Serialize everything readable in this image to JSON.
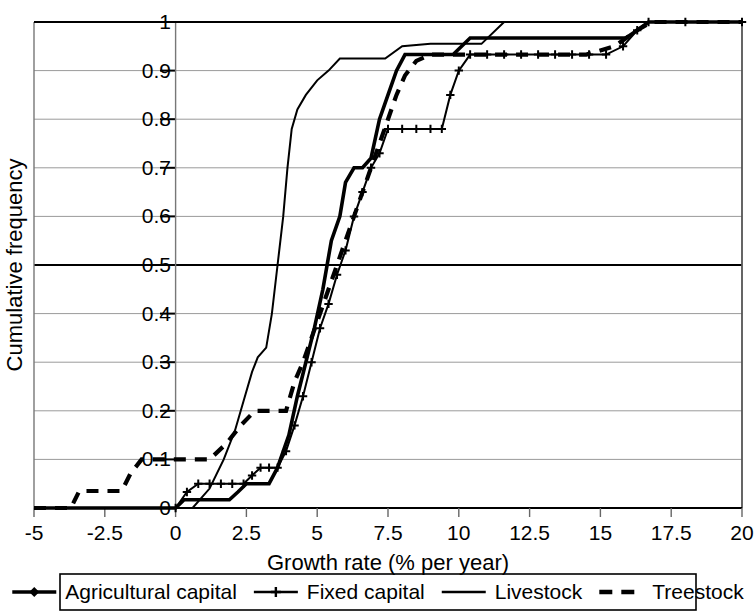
{
  "chart_data": {
    "type": "line",
    "title": "",
    "xlabel": "Growth rate (% per year)",
    "ylabel": "Cumulative frequency",
    "xlim": [
      -5,
      20
    ],
    "ylim": [
      0,
      1
    ],
    "grid": true,
    "legend_position": "bottom",
    "xticks": [
      "-5",
      "-2.5",
      "0",
      "2.5",
      "5",
      "7.5",
      "10",
      "12.5",
      "15",
      "17.5",
      "20"
    ],
    "xtick_values": [
      -5,
      -2.5,
      0,
      2.5,
      5,
      7.5,
      10,
      12.5,
      15,
      17.5,
      20
    ],
    "yticks": [
      "0",
      "0.1",
      "0.2",
      "0.3",
      "0.4",
      "0.5",
      "0.6",
      "0.7",
      "0.8",
      "0.9",
      "1"
    ],
    "ytick_values": [
      0,
      0.1,
      0.2,
      0.3,
      0.4,
      0.5,
      0.6,
      0.7,
      0.8,
      0.9,
      1
    ],
    "series": [
      {
        "name": "Agricultural capital",
        "style": "solid-thick-diamond",
        "marker": "diamond",
        "color": "#000000",
        "points": [
          [
            -5,
            0
          ],
          [
            -4.6,
            0
          ],
          [
            -4.2,
            0
          ],
          [
            -3.8,
            0
          ],
          [
            -3.4,
            0
          ],
          [
            -3.0,
            0
          ],
          [
            -2.6,
            0
          ],
          [
            -2.2,
            0
          ],
          [
            -1.8,
            0
          ],
          [
            -1.4,
            0
          ],
          [
            -1.0,
            0
          ],
          [
            -0.6,
            0
          ],
          [
            -0.2,
            0
          ],
          [
            0,
            0
          ],
          [
            0.3,
            0.017
          ],
          [
            0.7,
            0.017
          ],
          [
            1.1,
            0.017
          ],
          [
            1.5,
            0.017
          ],
          [
            1.9,
            0.017
          ],
          [
            2.2,
            0.033
          ],
          [
            2.5,
            0.05
          ],
          [
            2.9,
            0.05
          ],
          [
            3.3,
            0.05
          ],
          [
            3.6,
            0.083
          ],
          [
            4.0,
            0.15
          ],
          [
            4.3,
            0.23
          ],
          [
            4.6,
            0.3
          ],
          [
            4.9,
            0.37
          ],
          [
            5.2,
            0.45
          ],
          [
            5.5,
            0.55
          ],
          [
            5.8,
            0.6
          ],
          [
            6.0,
            0.67
          ],
          [
            6.3,
            0.7
          ],
          [
            6.6,
            0.7
          ],
          [
            6.9,
            0.72
          ],
          [
            7.2,
            0.8
          ],
          [
            7.5,
            0.85
          ],
          [
            7.8,
            0.9
          ],
          [
            8.1,
            0.933
          ],
          [
            8.6,
            0.933
          ],
          [
            9.2,
            0.933
          ],
          [
            9.8,
            0.933
          ],
          [
            10.4,
            0.967
          ],
          [
            11.0,
            0.967
          ],
          [
            11.7,
            0.967
          ],
          [
            12.4,
            0.967
          ],
          [
            13.1,
            0.967
          ],
          [
            13.8,
            0.967
          ],
          [
            14.5,
            0.967
          ],
          [
            15.2,
            0.967
          ],
          [
            15.9,
            0.967
          ],
          [
            16.3,
            0.983
          ],
          [
            16.7,
            1.0
          ],
          [
            17.3,
            1.0
          ],
          [
            17.9,
            1.0
          ],
          [
            18.5,
            1.0
          ],
          [
            19.1,
            1.0
          ],
          [
            19.6,
            1.0
          ],
          [
            20,
            1.0
          ]
        ]
      },
      {
        "name": "Fixed capital",
        "style": "solid-thin-cross",
        "marker": "cross",
        "color": "#000000",
        "points": [
          [
            0,
            0
          ],
          [
            0.4,
            0.033
          ],
          [
            0.8,
            0.05
          ],
          [
            1.2,
            0.05
          ],
          [
            1.6,
            0.05
          ],
          [
            2.0,
            0.05
          ],
          [
            2.4,
            0.05
          ],
          [
            2.7,
            0.067
          ],
          [
            3.0,
            0.083
          ],
          [
            3.3,
            0.083
          ],
          [
            3.6,
            0.083
          ],
          [
            3.9,
            0.117
          ],
          [
            4.2,
            0.17
          ],
          [
            4.5,
            0.23
          ],
          [
            4.8,
            0.3
          ],
          [
            5.1,
            0.37
          ],
          [
            5.4,
            0.42
          ],
          [
            5.7,
            0.48
          ],
          [
            6.0,
            0.53
          ],
          [
            6.3,
            0.6
          ],
          [
            6.6,
            0.65
          ],
          [
            6.9,
            0.7
          ],
          [
            7.2,
            0.73
          ],
          [
            7.5,
            0.78
          ],
          [
            8.0,
            0.78
          ],
          [
            8.5,
            0.78
          ],
          [
            9.0,
            0.78
          ],
          [
            9.4,
            0.78
          ],
          [
            9.7,
            0.85
          ],
          [
            10.0,
            0.9
          ],
          [
            10.4,
            0.933
          ],
          [
            11.0,
            0.933
          ],
          [
            11.6,
            0.933
          ],
          [
            12.2,
            0.933
          ],
          [
            12.8,
            0.933
          ],
          [
            13.4,
            0.933
          ],
          [
            14.0,
            0.933
          ],
          [
            14.6,
            0.933
          ],
          [
            15.2,
            0.933
          ],
          [
            15.8,
            0.95
          ],
          [
            16.3,
            0.983
          ],
          [
            16.7,
            1.0
          ],
          [
            18,
            1.0
          ],
          [
            20,
            1.0
          ]
        ]
      },
      {
        "name": "Livestock",
        "style": "solid-thin",
        "marker": "none",
        "color": "#000000",
        "points": [
          [
            0,
            0
          ],
          [
            0.6,
            0.0
          ],
          [
            1.2,
            0.04
          ],
          [
            1.7,
            0.1
          ],
          [
            2.1,
            0.16
          ],
          [
            2.4,
            0.22
          ],
          [
            2.7,
            0.28
          ],
          [
            2.9,
            0.31
          ],
          [
            3.2,
            0.33
          ],
          [
            3.4,
            0.4
          ],
          [
            3.6,
            0.5
          ],
          [
            3.8,
            0.6
          ],
          [
            3.95,
            0.7
          ],
          [
            4.1,
            0.78
          ],
          [
            4.3,
            0.82
          ],
          [
            4.6,
            0.85
          ],
          [
            5.0,
            0.88
          ],
          [
            5.4,
            0.9
          ],
          [
            5.8,
            0.925
          ],
          [
            7.4,
            0.925
          ],
          [
            8.0,
            0.95
          ],
          [
            9.0,
            0.955
          ],
          [
            10.8,
            0.955
          ],
          [
            11.6,
            1.0
          ],
          [
            14,
            1.0
          ],
          [
            17,
            1.0
          ],
          [
            20,
            1.0
          ]
        ]
      },
      {
        "name": "Treestock",
        "style": "dashed-thick",
        "marker": "none",
        "color": "#000000",
        "points": [
          [
            -5,
            0
          ],
          [
            -3.7,
            0
          ],
          [
            -3.4,
            0.035
          ],
          [
            -2.8,
            0.035
          ],
          [
            -1.9,
            0.035
          ],
          [
            -1.6,
            0.07
          ],
          [
            -1.2,
            0.1
          ],
          [
            -0.6,
            0.1
          ],
          [
            0,
            0.1
          ],
          [
            0.6,
            0.1
          ],
          [
            1.2,
            0.1
          ],
          [
            1.8,
            0.133
          ],
          [
            2.3,
            0.17
          ],
          [
            2.8,
            0.2
          ],
          [
            3.4,
            0.2
          ],
          [
            3.9,
            0.2
          ],
          [
            4.2,
            0.26
          ],
          [
            4.5,
            0.3
          ],
          [
            4.8,
            0.35
          ],
          [
            5.1,
            0.4
          ],
          [
            5.4,
            0.45
          ],
          [
            5.7,
            0.5
          ],
          [
            6.0,
            0.55
          ],
          [
            6.3,
            0.6
          ],
          [
            6.6,
            0.65
          ],
          [
            6.9,
            0.7
          ],
          [
            7.2,
            0.75
          ],
          [
            7.5,
            0.8
          ],
          [
            7.8,
            0.85
          ],
          [
            8.1,
            0.89
          ],
          [
            8.5,
            0.92
          ],
          [
            9.0,
            0.933
          ],
          [
            10.0,
            0.933
          ],
          [
            11.5,
            0.933
          ],
          [
            13.0,
            0.933
          ],
          [
            14.5,
            0.933
          ],
          [
            15.5,
            0.95
          ],
          [
            16.3,
            0.983
          ],
          [
            16.8,
            1.0
          ],
          [
            18.5,
            1.0
          ],
          [
            20,
            1.0
          ]
        ]
      }
    ]
  },
  "legend": {
    "items": [
      {
        "label": "Agricultural capital",
        "marker": "diamond",
        "line": "solid-thick"
      },
      {
        "label": "Fixed capital",
        "marker": "cross",
        "line": "solid-thin"
      },
      {
        "label": "Livestock",
        "marker": "none",
        "line": "solid-thin"
      },
      {
        "label": "Treestock",
        "marker": "none",
        "line": "dashed-thick"
      }
    ]
  },
  "colors": {
    "ink": "#000000",
    "grid": "#9a9a9a",
    "axis": "#555555",
    "emphasis": "#000000",
    "background": "#ffffff"
  }
}
